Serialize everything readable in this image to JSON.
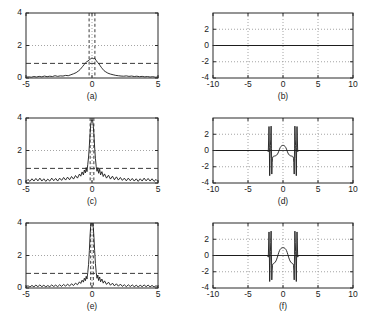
{
  "figure": {
    "background": "#ffffff",
    "line_color": "#1a1a1a",
    "grid_color": "#9a9a9a",
    "axis_color": "#2b2b2b",
    "width": 371,
    "height": 317
  },
  "panels": [
    {
      "id": "a",
      "caption": "(a)",
      "xticklabels": [
        "-5",
        "0",
        "5"
      ],
      "yticklabels": [
        "0",
        "2",
        "4"
      ]
    },
    {
      "id": "b",
      "caption": "(b)",
      "xticklabels": [
        "-10",
        "-5",
        "0",
        "5",
        "10"
      ],
      "yticklabels": [
        "-4",
        "-2",
        "0",
        "2"
      ]
    },
    {
      "id": "c",
      "caption": "(c)",
      "xticklabels": [
        "-5",
        "0",
        "5"
      ],
      "yticklabels": [
        "0",
        "2",
        "4"
      ]
    },
    {
      "id": "d",
      "caption": "(d)",
      "xticklabels": [
        "-10",
        "-5",
        "0",
        "5",
        "10"
      ],
      "yticklabels": [
        "-4",
        "-2",
        "0",
        "2"
      ]
    },
    {
      "id": "e",
      "caption": "(e)",
      "xticklabels": [
        "-5",
        "0",
        "5"
      ],
      "yticklabels": [
        "0",
        "2",
        "4"
      ]
    },
    {
      "id": "f",
      "caption": "(f)",
      "xticklabels": [
        "-10",
        "-5",
        "0",
        "5",
        "10"
      ],
      "yticklabels": [
        "-4",
        "-2",
        "0",
        "2"
      ]
    }
  ],
  "chart_data": [
    {
      "id": "a",
      "type": "line",
      "title": "(a)",
      "xlabel": "",
      "ylabel": "",
      "xlim": [
        -5,
        5
      ],
      "ylim": [
        0,
        4
      ],
      "xticks": [
        -5,
        0,
        5
      ],
      "yticks": [
        0,
        2,
        4
      ],
      "grid": true,
      "gridlines_h": [
        2
      ],
      "gridlines_v": [
        0
      ],
      "threshold_line": 0.9,
      "vertical_dashed_lines": [
        -0.22,
        0.22
      ],
      "series": [
        {
          "name": "magnitude",
          "x": [
            -5.0,
            -4.8,
            -4.6,
            -4.4,
            -4.2,
            -4.0,
            -3.8,
            -3.6,
            -3.4,
            -3.2,
            -3.0,
            -2.8,
            -2.6,
            -2.4,
            -2.2,
            -2.0,
            -1.8,
            -1.6,
            -1.4,
            -1.2,
            -1.0,
            -0.9,
            -0.8,
            -0.7,
            -0.6,
            -0.5,
            -0.4,
            -0.3,
            -0.2,
            -0.1,
            0.0,
            0.1,
            0.2,
            0.3,
            0.4,
            0.5,
            0.6,
            0.7,
            0.8,
            0.9,
            1.0,
            1.2,
            1.4,
            1.6,
            1.8,
            2.0,
            2.2,
            2.4,
            2.6,
            2.8,
            3.0,
            3.2,
            3.4,
            3.6,
            3.8,
            4.0,
            4.2,
            4.4,
            4.6,
            4.8,
            5.0
          ],
          "y": [
            0.05,
            0.07,
            0.05,
            0.09,
            0.06,
            0.1,
            0.07,
            0.12,
            0.08,
            0.11,
            0.09,
            0.14,
            0.1,
            0.13,
            0.12,
            0.16,
            0.14,
            0.2,
            0.26,
            0.33,
            0.45,
            0.52,
            0.62,
            0.72,
            0.82,
            0.93,
            1.0,
            1.05,
            1.12,
            1.18,
            1.24,
            1.19,
            1.22,
            1.1,
            0.98,
            0.9,
            0.78,
            0.66,
            0.56,
            0.46,
            0.4,
            0.3,
            0.24,
            0.2,
            0.16,
            0.14,
            0.12,
            0.11,
            0.13,
            0.1,
            0.12,
            0.09,
            0.11,
            0.08,
            0.1,
            0.07,
            0.09,
            0.06,
            0.08,
            0.05,
            0.06
          ]
        }
      ]
    },
    {
      "id": "b",
      "type": "line",
      "title": "(b)",
      "xlabel": "",
      "ylabel": "",
      "xlim": [
        -10,
        10
      ],
      "ylim": [
        -4,
        4
      ],
      "xticks": [
        -10,
        -5,
        0,
        5,
        10
      ],
      "yticks": [
        -4,
        -2,
        0,
        2
      ],
      "grid": true,
      "gridlines_h": [
        -2,
        2
      ],
      "gridlines_v": [
        -5,
        0,
        5
      ],
      "zero_line": 0,
      "series": [
        {
          "name": "phase",
          "x": [
            -10,
            10
          ],
          "y": [
            0,
            0
          ]
        }
      ]
    },
    {
      "id": "c",
      "type": "line",
      "title": "(c)",
      "xlabel": "",
      "ylabel": "",
      "xlim": [
        -5,
        5
      ],
      "ylim": [
        0,
        4
      ],
      "xticks": [
        -5,
        0,
        5
      ],
      "yticks": [
        0,
        2,
        4
      ],
      "grid": true,
      "gridlines_h": [
        2
      ],
      "gridlines_v": [
        0
      ],
      "threshold_line": 0.9,
      "vertical_dashed_lines": [
        -0.14,
        0.14
      ],
      "peak_value": 3.9,
      "series": [
        {
          "name": "magnitude",
          "x": [
            -5.0,
            -4.85,
            -4.7,
            -4.55,
            -4.4,
            -4.25,
            -4.1,
            -3.95,
            -3.8,
            -3.65,
            -3.5,
            -3.35,
            -3.2,
            -3.05,
            -2.9,
            -2.75,
            -2.6,
            -2.45,
            -2.3,
            -2.15,
            -2.0,
            -1.85,
            -1.7,
            -1.55,
            -1.4,
            -1.25,
            -1.1,
            -0.95,
            -0.85,
            -0.75,
            -0.65,
            -0.58,
            -0.5,
            -0.44,
            -0.38,
            -0.32,
            -0.26,
            -0.2,
            -0.15,
            -0.1,
            -0.05,
            0.0,
            0.05,
            0.1,
            0.15,
            0.2,
            0.26,
            0.32,
            0.38,
            0.44,
            0.5,
            0.58,
            0.65,
            0.75,
            0.85,
            0.95,
            1.1,
            1.25,
            1.4,
            1.55,
            1.7,
            1.85,
            2.0,
            2.15,
            2.3,
            2.45,
            2.6,
            2.75,
            2.9,
            3.05,
            3.2,
            3.35,
            3.5,
            3.65,
            3.8,
            3.95,
            4.1,
            4.25,
            4.4,
            4.55,
            4.7,
            4.85,
            5.0
          ],
          "y": [
            0.1,
            0.22,
            0.1,
            0.26,
            0.12,
            0.28,
            0.13,
            0.3,
            0.12,
            0.26,
            0.1,
            0.24,
            0.12,
            0.3,
            0.14,
            0.28,
            0.12,
            0.3,
            0.16,
            0.34,
            0.18,
            0.36,
            0.2,
            0.4,
            0.24,
            0.46,
            0.3,
            0.55,
            0.42,
            0.68,
            0.5,
            0.8,
            0.62,
            0.95,
            0.7,
            1.15,
            1.6,
            2.3,
            3.0,
            3.55,
            3.8,
            3.9,
            3.8,
            3.5,
            2.95,
            2.2,
            1.5,
            1.0,
            0.72,
            0.95,
            0.6,
            0.85,
            0.5,
            0.7,
            0.4,
            0.56,
            0.3,
            0.48,
            0.24,
            0.42,
            0.2,
            0.38,
            0.18,
            0.34,
            0.16,
            0.3,
            0.13,
            0.3,
            0.14,
            0.28,
            0.12,
            0.26,
            0.1,
            0.26,
            0.12,
            0.3,
            0.13,
            0.28,
            0.12,
            0.26,
            0.1,
            0.22,
            0.1
          ]
        }
      ]
    },
    {
      "id": "d",
      "type": "line",
      "title": "(d)",
      "xlabel": "",
      "ylabel": "",
      "xlim": [
        -10,
        10
      ],
      "ylim": [
        -4,
        4
      ],
      "xticks": [
        -10,
        -5,
        0,
        5,
        10
      ],
      "yticks": [
        -4,
        -2,
        0,
        2
      ],
      "grid": true,
      "gridlines_h": [
        -2,
        2
      ],
      "gridlines_v": [
        -5,
        0,
        5
      ],
      "zero_line": 0,
      "series": [
        {
          "name": "phase",
          "x": [
            -10.0,
            -2.2,
            -2.1,
            -2.0,
            -1.95,
            -1.9,
            -1.85,
            -1.8,
            -1.75,
            -1.7,
            -1.65,
            -1.6,
            -1.55,
            -1.5,
            -1.45,
            -1.4,
            -1.35,
            -1.3,
            -1.2,
            -1.1,
            -1.0,
            -0.9,
            -0.8,
            -0.7,
            -0.6,
            -0.5,
            -0.4,
            -0.3,
            -0.2,
            -0.1,
            0.0,
            0.1,
            0.2,
            0.3,
            0.4,
            0.5,
            0.6,
            0.7,
            0.8,
            0.9,
            1.0,
            1.1,
            1.2,
            1.3,
            1.35,
            1.4,
            1.45,
            1.5,
            1.55,
            1.6,
            1.65,
            1.7,
            1.75,
            1.8,
            1.85,
            1.9,
            1.95,
            2.0,
            2.1,
            2.2,
            10.0
          ],
          "y": [
            0.0,
            0.0,
            -0.15,
            2.95,
            0.4,
            -3.1,
            -1.0,
            0.6,
            1.4,
            3.0,
            0.2,
            -2.9,
            -1.5,
            -0.95,
            -0.8,
            -0.75,
            -0.7,
            -0.7,
            -0.68,
            -0.66,
            -0.62,
            -0.56,
            -0.46,
            -0.3,
            -0.08,
            0.16,
            0.36,
            0.5,
            0.58,
            0.62,
            0.63,
            0.62,
            0.58,
            0.5,
            0.36,
            0.16,
            -0.08,
            -0.3,
            -0.46,
            -0.56,
            -0.62,
            -0.66,
            -0.68,
            -0.7,
            -0.7,
            -0.75,
            -0.8,
            -0.95,
            -1.5,
            -2.9,
            0.2,
            3.0,
            1.4,
            0.6,
            -1.0,
            -3.1,
            0.4,
            2.95,
            -0.15,
            0.0,
            0.0
          ]
        }
      ]
    },
    {
      "id": "e",
      "type": "line",
      "title": "(e)",
      "xlabel": "",
      "ylabel": "",
      "xlim": [
        -5,
        5
      ],
      "ylim": [
        0,
        4
      ],
      "xticks": [
        -5,
        0,
        5
      ],
      "yticks": [
        0,
        2,
        4
      ],
      "grid": true,
      "gridlines_h": [
        2
      ],
      "gridlines_v": [
        0
      ],
      "threshold_line": 0.9,
      "vertical_dashed_lines": [
        -0.1,
        0.1
      ],
      "peak_value": 4.0,
      "series": [
        {
          "name": "magnitude",
          "x": [
            -5.0,
            -4.85,
            -4.7,
            -4.55,
            -4.4,
            -4.25,
            -4.1,
            -3.95,
            -3.8,
            -3.65,
            -3.5,
            -3.35,
            -3.2,
            -3.05,
            -2.9,
            -2.75,
            -2.6,
            -2.45,
            -2.3,
            -2.15,
            -2.0,
            -1.85,
            -1.7,
            -1.55,
            -1.4,
            -1.25,
            -1.1,
            -0.95,
            -0.85,
            -0.75,
            -0.65,
            -0.58,
            -0.5,
            -0.44,
            -0.38,
            -0.32,
            -0.26,
            -0.2,
            -0.15,
            -0.1,
            -0.05,
            0.0,
            0.05,
            0.1,
            0.15,
            0.2,
            0.26,
            0.32,
            0.38,
            0.44,
            0.5,
            0.58,
            0.65,
            0.75,
            0.85,
            0.95,
            1.1,
            1.25,
            1.4,
            1.55,
            1.7,
            1.85,
            2.0,
            2.15,
            2.3,
            2.45,
            2.6,
            2.75,
            2.9,
            3.05,
            3.2,
            3.35,
            3.5,
            3.65,
            3.8,
            3.95,
            4.1,
            4.25,
            4.4,
            4.55,
            4.7,
            4.85,
            5.0
          ],
          "y": [
            0.06,
            0.14,
            0.06,
            0.16,
            0.07,
            0.18,
            0.08,
            0.19,
            0.08,
            0.17,
            0.07,
            0.15,
            0.08,
            0.19,
            0.09,
            0.18,
            0.08,
            0.2,
            0.1,
            0.22,
            0.11,
            0.24,
            0.12,
            0.26,
            0.15,
            0.3,
            0.2,
            0.38,
            0.28,
            0.48,
            0.36,
            0.6,
            0.45,
            0.72,
            0.55,
            0.95,
            1.45,
            2.3,
            3.2,
            3.8,
            3.96,
            4.0,
            3.96,
            3.7,
            3.1,
            2.3,
            1.5,
            0.95,
            0.6,
            0.8,
            0.46,
            0.68,
            0.38,
            0.55,
            0.3,
            0.44,
            0.22,
            0.36,
            0.17,
            0.3,
            0.13,
            0.26,
            0.11,
            0.24,
            0.1,
            0.2,
            0.08,
            0.2,
            0.09,
            0.19,
            0.08,
            0.17,
            0.07,
            0.17,
            0.08,
            0.19,
            0.08,
            0.18,
            0.07,
            0.16,
            0.06,
            0.14,
            0.06
          ]
        }
      ]
    },
    {
      "id": "f",
      "type": "line",
      "title": "(f)",
      "xlabel": "",
      "ylabel": "",
      "xlim": [
        -10,
        10
      ],
      "ylim": [
        -4,
        4
      ],
      "xticks": [
        -10,
        -5,
        0,
        5,
        10
      ],
      "yticks": [
        -4,
        -2,
        0,
        2
      ],
      "grid": true,
      "gridlines_h": [
        -2,
        2
      ],
      "gridlines_v": [
        -5,
        0,
        5
      ],
      "zero_line": 0,
      "series": [
        {
          "name": "phase",
          "x": [
            -10.0,
            -2.2,
            -2.1,
            -2.0,
            -1.95,
            -1.9,
            -1.85,
            -1.8,
            -1.75,
            -1.7,
            -1.65,
            -1.6,
            -1.55,
            -1.5,
            -1.45,
            -1.4,
            -1.35,
            -1.3,
            -1.2,
            -1.1,
            -1.0,
            -0.9,
            -0.8,
            -0.7,
            -0.6,
            -0.5,
            -0.4,
            -0.3,
            -0.2,
            -0.1,
            0.0,
            0.1,
            0.2,
            0.3,
            0.4,
            0.5,
            0.6,
            0.7,
            0.8,
            0.9,
            1.0,
            1.1,
            1.2,
            1.3,
            1.35,
            1.4,
            1.45,
            1.5,
            1.55,
            1.6,
            1.65,
            1.7,
            1.75,
            1.8,
            1.85,
            1.9,
            1.95,
            2.0,
            2.1,
            2.2,
            10.0
          ],
          "y": [
            0.0,
            0.0,
            -0.2,
            2.9,
            0.3,
            -3.2,
            -1.2,
            0.5,
            1.6,
            3.0,
            0.1,
            -3.0,
            -1.8,
            -1.2,
            -1.05,
            -1.0,
            -0.98,
            -0.96,
            -0.9,
            -0.8,
            -0.66,
            -0.45,
            -0.2,
            0.1,
            0.38,
            0.6,
            0.76,
            0.86,
            0.92,
            0.95,
            0.96,
            0.95,
            0.92,
            0.86,
            0.76,
            0.6,
            0.38,
            0.1,
            -0.2,
            -0.45,
            -0.66,
            -0.8,
            -0.9,
            -0.96,
            -0.98,
            -1.0,
            -1.05,
            -1.2,
            -1.8,
            -3.0,
            0.1,
            3.0,
            1.6,
            0.5,
            -1.2,
            -3.2,
            0.3,
            2.9,
            -0.2,
            0.0,
            0.0
          ]
        }
      ]
    }
  ]
}
